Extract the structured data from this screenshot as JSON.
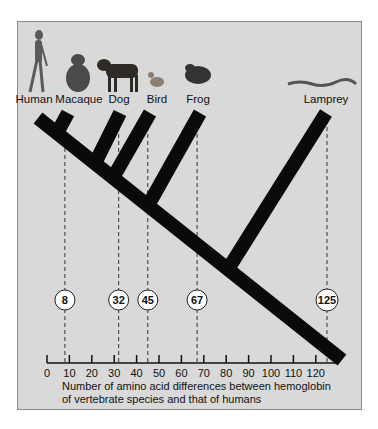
{
  "figure": {
    "species": [
      {
        "name": "Human",
        "icon": "human-icon",
        "differences": 0
      },
      {
        "name": "Macaque",
        "icon": "macaque-icon",
        "differences": 8
      },
      {
        "name": "Dog",
        "icon": "dog-icon",
        "differences": 32
      },
      {
        "name": "Bird",
        "icon": "bird-icon",
        "differences": 45
      },
      {
        "name": "Frog",
        "icon": "frog-icon",
        "differences": 67
      },
      {
        "name": "Lamprey",
        "icon": "lamprey-icon",
        "differences": 125
      }
    ],
    "badges": [
      "8",
      "32",
      "45",
      "67",
      "125"
    ],
    "axis": {
      "ticks": [
        "0",
        "10",
        "20",
        "30",
        "40",
        "50",
        "60",
        "70",
        "80",
        "90",
        "100",
        "110",
        "120"
      ],
      "min": 0,
      "max": 120,
      "caption_line1": "Number of amino acid differences between hemoglobin",
      "caption_line2": "of vertebrate species and that of humans"
    },
    "colors": {
      "panel": "#d9d9d9",
      "branch": "#0a0a0a",
      "badge_fill": "#ffffff"
    }
  }
}
